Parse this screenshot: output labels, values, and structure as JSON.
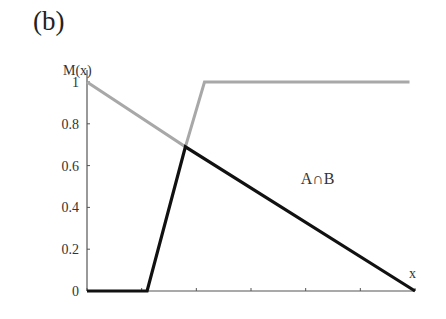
{
  "panel_label": "(b)",
  "chart_data": {
    "type": "line",
    "title": "(b)",
    "xlabel": "x",
    "ylabel": "M(x)",
    "xlim": [
      0,
      6
    ],
    "ylim": [
      0,
      1
    ],
    "y_ticks": [
      "0",
      "0.2",
      "0.4",
      "0.6",
      "0.8",
      "1"
    ],
    "x_ticks": [
      0,
      1,
      2,
      3,
      4,
      5,
      6
    ],
    "x_tick_labels_shown": false,
    "grid": false,
    "legend": null,
    "annotations": [
      {
        "text": "A∩B",
        "x": 4.0,
        "y": 0.52
      }
    ],
    "series": [
      {
        "name": "max-envelope (gray)",
        "color": "#a8a8a8",
        "points": [
          [
            0,
            1.0
          ],
          [
            1.8,
            0.69
          ],
          [
            2.15,
            1.0
          ],
          [
            5.9,
            1.0
          ]
        ]
      },
      {
        "name": "A∩B",
        "color": "#111111",
        "points": [
          [
            0,
            0.0
          ],
          [
            1.1,
            0.0
          ],
          [
            1.8,
            0.69
          ],
          [
            6.0,
            0.0
          ]
        ]
      }
    ]
  },
  "colors": {
    "axis": "#555555",
    "gray_line": "#a8a8a8",
    "black_line": "#111111"
  }
}
